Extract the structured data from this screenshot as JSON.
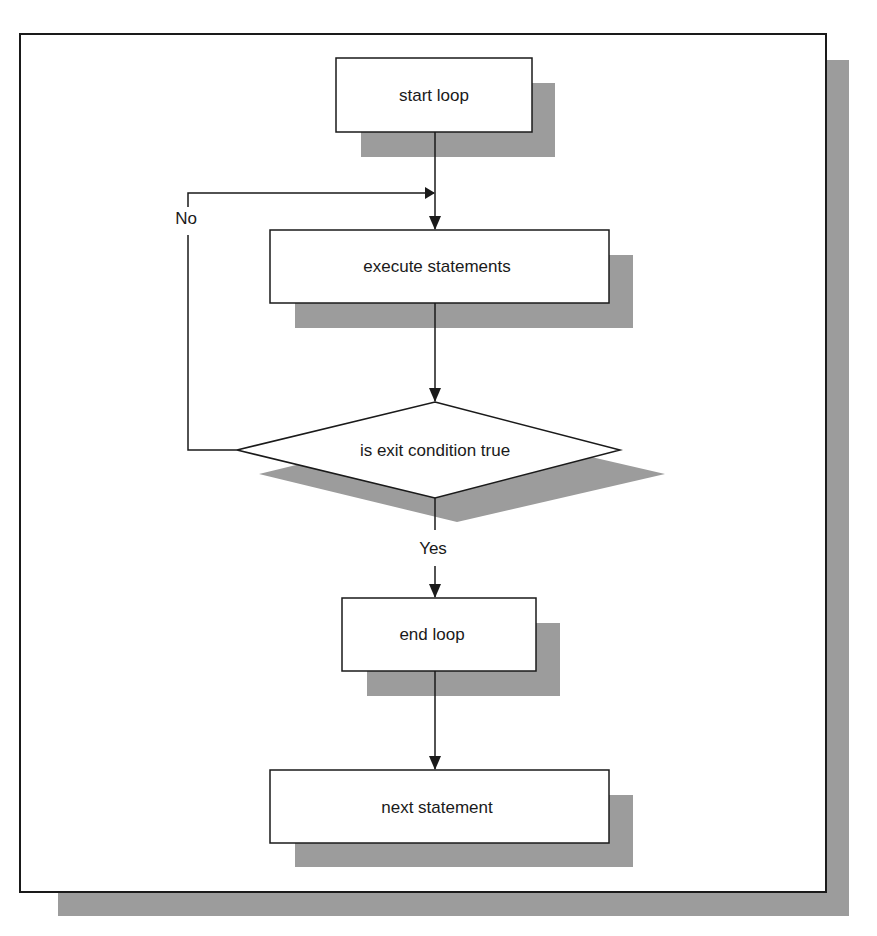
{
  "diagram": {
    "type": "flowchart",
    "title": "",
    "colors": {
      "stroke": "#1a1a1a",
      "shadow": "#9c9c9c",
      "fill": "#ffffff",
      "background": "#ffffff"
    },
    "nodes": [
      {
        "id": "start",
        "shape": "rectangle",
        "label": "start loop"
      },
      {
        "id": "execute",
        "shape": "rectangle",
        "label": "execute statements"
      },
      {
        "id": "condition",
        "shape": "diamond",
        "label": "is exit condition true"
      },
      {
        "id": "end",
        "shape": "rectangle",
        "label": "end loop"
      },
      {
        "id": "next",
        "shape": "rectangle",
        "label": "next statement"
      }
    ],
    "edges": [
      {
        "from": "start",
        "to": "execute",
        "label": ""
      },
      {
        "from": "execute",
        "to": "condition",
        "label": ""
      },
      {
        "from": "condition",
        "to": "execute",
        "label": "No"
      },
      {
        "from": "condition",
        "to": "end",
        "label": "Yes"
      },
      {
        "from": "end",
        "to": "next",
        "label": ""
      }
    ],
    "edge_labels": {
      "no": "No",
      "yes": "Yes"
    }
  }
}
